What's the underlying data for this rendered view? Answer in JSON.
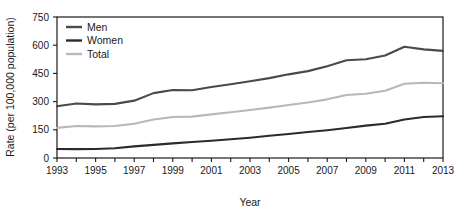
{
  "chart_data": {
    "type": "line",
    "title": "",
    "xlabel": "Year",
    "ylabel": "Rate (per 100,000 population)",
    "xlim": [
      1993,
      2013
    ],
    "ylim": [
      0,
      750
    ],
    "grid": false,
    "legend_position": "top-left",
    "x": [
      1993,
      1994,
      1995,
      1996,
      1997,
      1998,
      1999,
      2000,
      2001,
      2002,
      2003,
      2004,
      2005,
      2006,
      2007,
      2008,
      2009,
      2010,
      2011,
      2012,
      2013
    ],
    "x_tick_labels": [
      "1993",
      "1995",
      "1997",
      "1999",
      "2001",
      "2003",
      "2005",
      "2007",
      "2009",
      "2011",
      "2013"
    ],
    "y_tick_labels": [
      "0",
      "150",
      "300",
      "450",
      "600",
      "750"
    ],
    "y_ticks": [
      0,
      150,
      300,
      450,
      600,
      750
    ],
    "series": [
      {
        "name": "Men",
        "color": "#4a4a4a",
        "values": [
          275,
          290,
          285,
          288,
          305,
          345,
          362,
          360,
          378,
          392,
          408,
          425,
          445,
          462,
          488,
          520,
          525,
          545,
          592,
          578,
          570
        ]
      },
      {
        "name": "Women",
        "color": "#2b2b2b",
        "values": [
          48,
          47,
          48,
          52,
          62,
          70,
          78,
          85,
          92,
          100,
          108,
          118,
          128,
          138,
          148,
          160,
          172,
          182,
          205,
          218,
          222
        ]
      },
      {
        "name": "Total",
        "color": "#b8b8b8",
        "values": [
          160,
          170,
          168,
          170,
          182,
          205,
          218,
          220,
          232,
          243,
          255,
          268,
          282,
          295,
          312,
          335,
          342,
          358,
          395,
          400,
          398
        ]
      }
    ]
  },
  "legend": {
    "entries": [
      {
        "label": "Men"
      },
      {
        "label": "Women"
      },
      {
        "label": "Total"
      }
    ]
  },
  "axes": {
    "y_title": "Rate (per 100,000 population)",
    "x_title": "Year"
  }
}
